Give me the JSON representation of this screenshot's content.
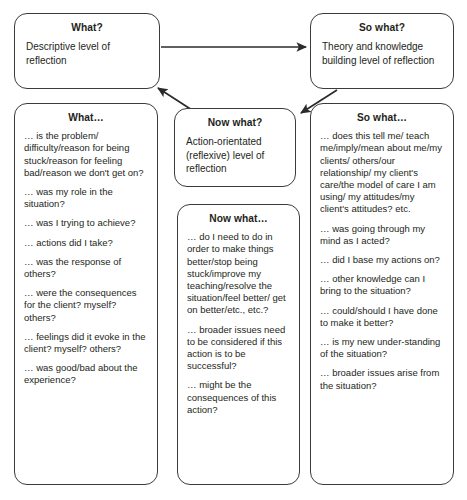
{
  "diagram": {
    "line_color": "#3b3b3b",
    "text_color": "#231f20",
    "background": "#ffffff"
  },
  "boxes": {
    "what_top": {
      "title": "What?",
      "subtitle": "Descriptive level of reflection"
    },
    "so_what_top": {
      "title": "So what?",
      "subtitle": "Theory and knowledge building level of reflection"
    },
    "now_what_top": {
      "title": "Now what?",
      "subtitle": "Action-orientated (reflexive) level of reflection"
    },
    "what_list": {
      "title": "What…",
      "items": [
        "… is the problem/ difficulty/reason for being stuck/reason for feeling bad/reason we don't get on?",
        "… was my role in the situation?",
        "… was I trying to achieve?",
        "… actions did I take?",
        "… was the response of others?",
        "… were the consequences for the client? myself? others?",
        "… feelings did it evoke in the client? myself? others?",
        "… was good/bad about the experience?"
      ]
    },
    "now_what_list": {
      "title": "Now what…",
      "items": [
        "… do I need to do in order to make things better/stop being stuck/improve my teaching/resolve the situation/feel better/ get on better/etc., etc.?",
        "… broader issues need to be considered if this action is to be successful?",
        "… might be the consequences of this action?"
      ]
    },
    "so_what_list": {
      "title": "So what…",
      "items": [
        "… does this tell me/ teach me/imply/mean about me/my clients/ others/our relationship/ my client's care/the model of care I am using/ my attitudes/my client's attitudes? etc.",
        "… was going through my mind as I acted?",
        "… did I base my actions on?",
        "… other knowledge can I bring to the situation?",
        "… could/should I have done to make it better?",
        "… is my new under-standing of the situation?",
        "… broader issues arise from the situation?"
      ]
    }
  },
  "arrows": [
    {
      "name": "what-to-so-what",
      "from": "what_top",
      "to": "so_what_top",
      "direction": "right"
    },
    {
      "name": "so-what-to-now-what",
      "from": "so_what_top",
      "to": "now_what_top",
      "direction": "down-left"
    },
    {
      "name": "now-what-to-what",
      "from": "now_what_top",
      "to": "what_top",
      "direction": "up-left"
    }
  ]
}
